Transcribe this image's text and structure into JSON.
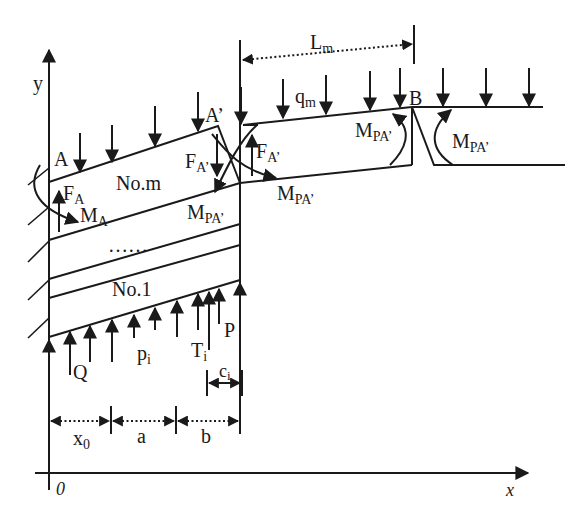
{
  "diagram": {
    "axes": {
      "x_label": "x",
      "y_label": "y",
      "origin_label": "0"
    },
    "points": {
      "A": "A",
      "A_prime": "A’",
      "B": "B"
    },
    "layers": {
      "top": "No.m",
      "bottom": "No.1",
      "ellipsis": "……"
    },
    "forces": {
      "F_A": {
        "base": "F",
        "sub": "A"
      },
      "M_A": {
        "base": "M",
        "sub": "A"
      },
      "F_A_prime_left": {
        "base": "F",
        "sub": "A’"
      },
      "F_A_prime_right": {
        "base": "F",
        "sub": "A’"
      },
      "M_PA_left": {
        "base": "M",
        "sub": "PA’"
      },
      "M_PA_right": {
        "base": "M",
        "sub": "PA’"
      },
      "M_PA_B_left": {
        "base": "M",
        "sub": "PA’"
      },
      "M_PA_B_right": {
        "base": "M",
        "sub": "PA’"
      },
      "q_m": {
        "base": "q",
        "sub": "m"
      },
      "Q": "Q",
      "p_i": {
        "base": "p",
        "sub": "i"
      },
      "T_i": {
        "base": "T",
        "sub": "i"
      },
      "P": "P"
    },
    "dimensions": {
      "L_m": {
        "base": "L",
        "sub": "m"
      },
      "c_i": {
        "base": "c",
        "sub": "i"
      },
      "x0": {
        "base": "x",
        "sub": "0"
      },
      "a": "a",
      "b": "b"
    }
  }
}
